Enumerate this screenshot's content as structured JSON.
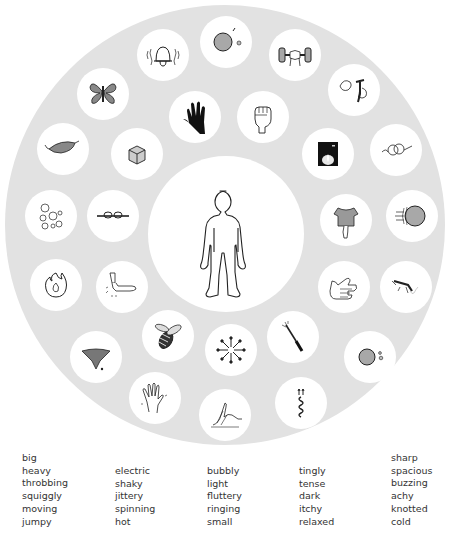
{
  "colors": {
    "ring": "#e2e2e2",
    "circle": "#ffffff",
    "ink": "#222222",
    "ball_fill": "#a8a8a8",
    "text": "#333333"
  },
  "center": {
    "icon": "child-body-outline-icon"
  },
  "icons": [
    {
      "id": "bell",
      "icon": "ringing-bell-icon"
    },
    {
      "id": "big-ball",
      "icon": "big-ball-icon"
    },
    {
      "id": "dumbbell",
      "icon": "heavy-dumbbell-icon"
    },
    {
      "id": "hands-twist",
      "icon": "twisting-hands-icon"
    },
    {
      "id": "butterfly",
      "icon": "butterfly-icon"
    },
    {
      "id": "dark-hand",
      "icon": "dark-hand-icon"
    },
    {
      "id": "fist",
      "icon": "clenched-fist-icon"
    },
    {
      "id": "feather",
      "icon": "feather-icon"
    },
    {
      "id": "dice",
      "icon": "cube-dice-icon"
    },
    {
      "id": "candle",
      "icon": "candle-in-dark-icon"
    },
    {
      "id": "yarn",
      "icon": "squiggly-yarn-icon"
    },
    {
      "id": "bubbles",
      "icon": "bubbles-icon"
    },
    {
      "id": "knot",
      "icon": "rope-knot-icon"
    },
    {
      "id": "shirt",
      "icon": "achy-torso-icon"
    },
    {
      "id": "moving-ball",
      "icon": "moving-ball-icon"
    },
    {
      "id": "fire",
      "icon": "flame-icon"
    },
    {
      "id": "arm",
      "icon": "shaky-arm-icon"
    },
    {
      "id": "hands-clasp",
      "icon": "clasped-hands-icon"
    },
    {
      "id": "mosquito",
      "icon": "mosquito-icon"
    },
    {
      "id": "bee",
      "icon": "buzzing-bee-icon"
    },
    {
      "id": "arrows",
      "icon": "spacious-arrows-icon"
    },
    {
      "id": "knife",
      "icon": "sharp-knife-icon"
    },
    {
      "id": "tornado",
      "icon": "spinning-tornado-icon"
    },
    {
      "id": "small-ball",
      "icon": "small-ball-icon"
    },
    {
      "id": "tingly-hand",
      "icon": "tingly-hand-icon"
    },
    {
      "id": "scratch",
      "icon": "itchy-scratch-icon"
    },
    {
      "id": "spring",
      "icon": "jumpy-spring-icon"
    }
  ],
  "word_columns": [
    [
      "big",
      "heavy",
      "throbbing",
      "squiggly",
      "moving",
      "jumpy"
    ],
    [
      "electric",
      "shaky",
      "jittery",
      "spinning",
      "hot"
    ],
    [
      "bubbly",
      "light",
      "fluttery",
      "ringing",
      "small"
    ],
    [
      "tingly",
      "tense",
      "dark",
      "itchy",
      "relaxed"
    ],
    [
      "sharp",
      "spacious",
      "buzzing",
      "achy",
      "knotted",
      "cold"
    ]
  ]
}
